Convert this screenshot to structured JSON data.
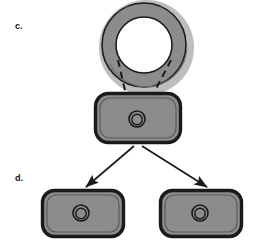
{
  "figure": {
    "kind": "biology-schematic",
    "panels": [
      {
        "id": "c",
        "label": "c."
      },
      {
        "id": "d",
        "label": "d."
      }
    ]
  },
  "colors": {
    "background": "#ffffff",
    "body_fill": "#8c8c8c",
    "body_outline": "#1a1a1a",
    "body_inner_line": "#4d4d4d",
    "ring_fill": "#8c8c8c",
    "ring_highlight": "#bdbdbd",
    "ring_outline": "#1a1a1a",
    "pore_outline": "#1a1a1a",
    "arrow_color": "#1a1a1a",
    "dashed_color": "#1a1a1a",
    "label_color": "#111111"
  },
  "elements": {
    "ring": {
      "name": "ring-structure",
      "cx": 144,
      "cy": 45,
      "outer_r": 42,
      "inner_r": 28,
      "highlight_side": "bottom-right"
    },
    "parent_body": {
      "name": "parent-rounded-rect",
      "x": 95,
      "y": 93,
      "width": 86,
      "height": 50,
      "radius": 13,
      "pore": {
        "cx": 136,
        "cy": 119,
        "outer_r": 8,
        "inner_r": 5
      }
    },
    "daughter_left": {
      "name": "daughter-rounded-rect-left",
      "x": 42,
      "y": 190,
      "width": 82,
      "height": 47,
      "radius": 12,
      "pore": {
        "cx": 80,
        "cy": 214,
        "outer_r": 8,
        "inner_r": 5
      }
    },
    "daughter_right": {
      "name": "daughter-rounded-rect-right",
      "x": 160,
      "y": 190,
      "width": 82,
      "height": 47,
      "radius": 12,
      "pore": {
        "cx": 200,
        "cy": 214,
        "outer_r": 8,
        "inner_r": 5
      }
    },
    "dashed_connectors": [
      {
        "name": "dashed-connector-left",
        "x1": 119,
        "y1": 62,
        "x2": 131,
        "y2": 112
      },
      {
        "name": "dashed-connector-right",
        "x1": 170,
        "y1": 62,
        "x2": 143,
        "y2": 112
      }
    ],
    "arrows": [
      {
        "name": "division-arrow-left",
        "x1": 133,
        "y1": 146,
        "x2": 88,
        "y2": 186
      },
      {
        "name": "division-arrow-right",
        "x1": 141,
        "y1": 146,
        "x2": 206,
        "y2": 186
      }
    ]
  }
}
